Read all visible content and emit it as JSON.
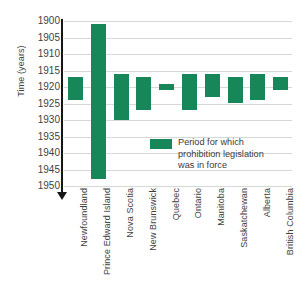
{
  "chart_data": {
    "type": "bar",
    "orientation": "vertical-range",
    "title": "",
    "xlabel": "",
    "ylabel": "Time (years)",
    "ylim": [
      1900,
      1950
    ],
    "y_inverted": true,
    "y_tick_step": 5,
    "grid": true,
    "legend_position": "inside-bottom-right",
    "series_color": "#17875a",
    "yticks": [
      1900,
      1905,
      1910,
      1915,
      1920,
      1925,
      1930,
      1935,
      1940,
      1945,
      1950
    ],
    "categories": [
      "Newfoundland",
      "Prince Edward Island",
      "Nova Scotia",
      "New Brunswick",
      "Quebec",
      "Ontario",
      "Manitoba",
      "Saskatchewan",
      "Alberta",
      "British Columbia"
    ],
    "bars": [
      {
        "category": "Newfoundland",
        "start": 1917,
        "end": 1924
      },
      {
        "category": "Prince Edward Island",
        "start": 1901,
        "end": 1948
      },
      {
        "category": "Nova Scotia",
        "start": 1916,
        "end": 1930
      },
      {
        "category": "New Brunswick",
        "start": 1917,
        "end": 1927
      },
      {
        "category": "Quebec",
        "start": 1919,
        "end": 1921
      },
      {
        "category": "Ontario",
        "start": 1916,
        "end": 1927
      },
      {
        "category": "Manitoba",
        "start": 1916,
        "end": 1923
      },
      {
        "category": "Saskatchewan",
        "start": 1917,
        "end": 1925
      },
      {
        "category": "Alberta",
        "start": 1916,
        "end": 1924
      },
      {
        "category": "British Columbia",
        "start": 1917,
        "end": 1921
      }
    ],
    "legend": [
      {
        "label": "Period for which prohibition legislation was in force",
        "color": "#17875a"
      }
    ]
  },
  "legend": {
    "line1": "Period for which",
    "line2": "prohibition legislation",
    "line3": "was in force"
  }
}
